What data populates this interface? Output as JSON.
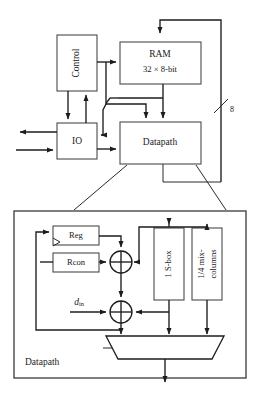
{
  "figure": {
    "line_color": "#1c1c1c",
    "block_stroke": "#4a4a4a",
    "background": "#ffffff"
  },
  "top_level": {
    "blocks": [
      {
        "id": "control",
        "label": "Control",
        "orientation": "vertical"
      },
      {
        "id": "ram",
        "label_line1": "RAM",
        "label_line2": "32 × 8-bit",
        "orientation": "horizontal"
      },
      {
        "id": "io",
        "label": "IO",
        "orientation": "horizontal"
      },
      {
        "id": "datapath",
        "label": "Datapath",
        "orientation": "horizontal"
      }
    ],
    "bus_label": "8"
  },
  "detail": {
    "corner_label": "Datapath",
    "blocks": [
      {
        "id": "reg",
        "label": "Reg",
        "orientation": "horizontal"
      },
      {
        "id": "rcon",
        "label": "Rcon",
        "orientation": "horizontal"
      },
      {
        "id": "sbox",
        "label": "1 S-box",
        "orientation": "vertical"
      },
      {
        "id": "mixcol",
        "label_line1": "1/4 mix-",
        "label_line2": "columns",
        "orientation": "vertical"
      }
    ],
    "input_label": {
      "symbol": "d",
      "subscript": "in"
    },
    "operators": [
      {
        "id": "xor-key",
        "symbol": "⊕"
      },
      {
        "id": "xor-data",
        "symbol": "⊕"
      }
    ],
    "mux": {
      "id": "output-mux",
      "label": ""
    }
  }
}
